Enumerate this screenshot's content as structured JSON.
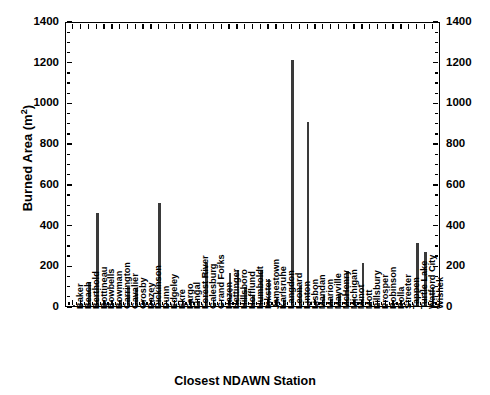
{
  "chart_data": {
    "type": "bar",
    "title": "",
    "xlabel": "Closest NDAWN Station",
    "ylabel": "Burned Area (m2)",
    "ylabel_base": "Burned Area (m",
    "ylabel_sup": "2",
    "ylabel_tail": ")",
    "ylim": [
      0,
      1400
    ],
    "ytick_step": 200,
    "yminor_step": 50,
    "grid": false,
    "legend": null,
    "axes": {
      "left_axis": true,
      "right_axis": true,
      "top_axis": true,
      "bottom_axis": true,
      "ticks_inward": true
    },
    "ytick_labels": [
      "0",
      "200",
      "400",
      "600",
      "800",
      "1000",
      "1200",
      "1400"
    ],
    "ytick_values": [
      0,
      200,
      400,
      600,
      800,
      1000,
      1200,
      1400
    ],
    "bar_color": "#3a3a3a",
    "categories": [
      "Baker",
      "Beach",
      "Berthold",
      "Bottineau",
      "Bowbells",
      "Bowman",
      "Carrington",
      "Cavalier",
      "Crosby",
      "Dazey",
      "Dickinson",
      "Dunn",
      "Edgeley",
      "Ekre",
      "Fargo",
      "Fingal",
      "Forest River",
      "Galesburg",
      "Grand Forks",
      "Hazen",
      "Hettinger",
      "Hillsboro",
      "Hofflund",
      "Humboldt",
      "Inkster",
      "Jamestown",
      "Karlsruhe",
      "Langdon",
      "Leonard",
      "Linton",
      "Lisbon",
      "Mandan",
      "Marion",
      "Mayville",
      "McHenry",
      "Michigan",
      "Minot",
      "Mott",
      "Pillsbury",
      "Prosper",
      "Robinson",
      "Rolla",
      "Streeter",
      "Tappen",
      "Turtle Lake",
      "Watford City",
      "Wishek"
    ],
    "values": [
      6,
      8,
      120,
      455,
      22,
      14,
      28,
      95,
      90,
      18,
      10,
      505,
      9,
      12,
      20,
      30,
      25,
      210,
      16,
      12,
      160,
      175,
      95,
      55,
      175,
      135,
      40,
      30,
      1207,
      100,
      905,
      22,
      55,
      35,
      60,
      170,
      30,
      210,
      15,
      14,
      12,
      10,
      9,
      8,
      310,
      265,
      95
    ],
    "value_unit": "m2",
    "notes": {
      "max_value": 1207,
      "max_category": "Leonard",
      "second_max_value": 905,
      "second_max_category": "Lisbon"
    }
  }
}
